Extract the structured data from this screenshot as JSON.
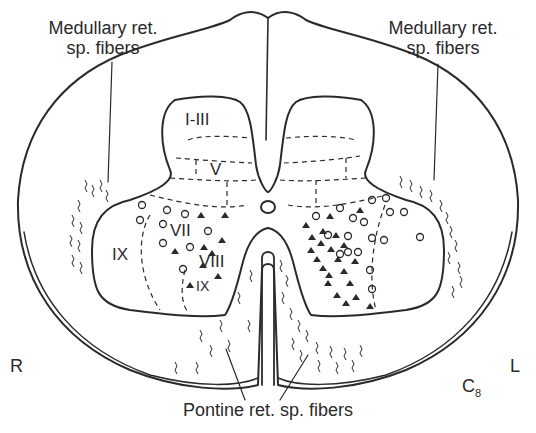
{
  "figure": {
    "segment": "C",
    "segment_sub": "8",
    "side_left": "R",
    "side_right": "L"
  },
  "labels": {
    "medullary_left_line1": "Medullary ret.",
    "medullary_left_line2": "sp. fibers",
    "medullary_right_line1": "Medullary ret.",
    "medullary_right_line2": "sp. fibers",
    "pontine": "Pontine ret. sp. fibers"
  },
  "laminae": {
    "l1_3": "I-III",
    "l5": "V",
    "l7": "VII",
    "l8": "VIII",
    "l9_lateral": "IX",
    "l9_medial": "IX"
  },
  "legend_symbols": {
    "open_circle": "circle-marker",
    "filled_triangle": "triangle-marker"
  },
  "colors": {
    "ink": "#2a2a2a",
    "background": "#ffffff"
  }
}
